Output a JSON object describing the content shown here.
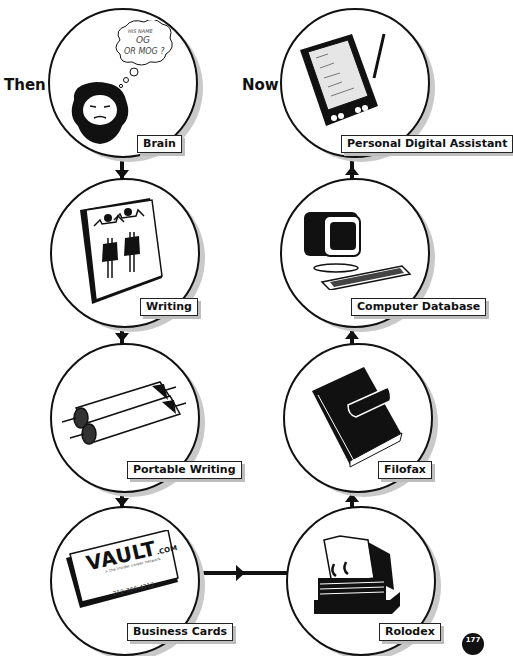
{
  "headings": {
    "left": "Then",
    "right": "Now"
  },
  "then_column": [
    {
      "label": "Brain",
      "icon": "caveman-head-icon",
      "thought_bubble": [
        "HIS NAME",
        "OG",
        "OR MOG ?"
      ]
    },
    {
      "label": "Writing",
      "icon": "stone-tablet-icon"
    },
    {
      "label": "Portable Writing",
      "icon": "scrolls-icon"
    },
    {
      "label": "Business Cards",
      "icon": "business-card-icon",
      "card": {
        "brand": "VAULT",
        "brand_suffix": ".COM",
        "tagline": "> the insider career network",
        "phone": "212-366-4212"
      }
    }
  ],
  "now_column": [
    {
      "label": "Personal Digital Assistant",
      "icon": "pda-icon"
    },
    {
      "label": "Computer Database",
      "icon": "computer-icon"
    },
    {
      "label": "Filofax",
      "icon": "organizer-book-icon"
    },
    {
      "label": "Rolodex",
      "icon": "rolodex-icon"
    }
  ],
  "page_number": "177",
  "colors": {
    "ink": "#111111",
    "shadow": "#c9c9c9",
    "background": "#ffffff"
  }
}
